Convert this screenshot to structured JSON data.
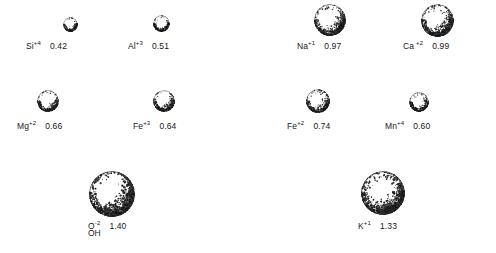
{
  "figure": {
    "background_color": "#ffffff",
    "text_color": "#171717",
    "units": "angstroms"
  },
  "chart_data": {
    "type": "scatter",
    "xlabel": "",
    "ylabel": "",
    "note": "Sphere diameter is proportional to the ionic radius value shown beside each label.",
    "categories": [
      "Si+4",
      "Al+3",
      "Na+1",
      "Ca+2",
      "Mg+2",
      "Fe+3",
      "Fe+2",
      "Mn+4",
      "O-2 / OH",
      "K+1"
    ],
    "values": [
      0.42,
      0.51,
      0.97,
      0.99,
      0.66,
      0.64,
      0.74,
      0.6,
      1.4,
      1.33
    ]
  },
  "ions": [
    {
      "id": "si",
      "symbol": "Si",
      "charge": "+4",
      "radius": "0.42",
      "sublabel": "",
      "sphere": {
        "cx": 70,
        "cy": 24,
        "d": 15
      },
      "label": {
        "x": 26,
        "y": 38
      }
    },
    {
      "id": "al",
      "symbol": "Al",
      "charge": "+3",
      "radius": "0.51",
      "sublabel": "",
      "sphere": {
        "cx": 161,
        "cy": 23,
        "d": 17
      },
      "label": {
        "x": 128,
        "y": 38
      }
    },
    {
      "id": "na",
      "symbol": "Na",
      "charge": "+1",
      "radius": "0.97",
      "sublabel": "",
      "sphere": {
        "cx": 330,
        "cy": 20,
        "d": 32
      },
      "label": {
        "x": 297,
        "y": 38
      }
    },
    {
      "id": "ca",
      "symbol": "Ca",
      "charge": "+2",
      "radius": "0.99",
      "sublabel": "",
      "sphere": {
        "cx": 437,
        "cy": 20,
        "d": 33
      },
      "label": {
        "x": 403,
        "y": 38
      }
    },
    {
      "id": "mg",
      "symbol": "Mg",
      "charge": "+2",
      "radius": "0.66",
      "sublabel": "",
      "sphere": {
        "cx": 48,
        "cy": 101,
        "d": 22
      },
      "label": {
        "x": 17,
        "y": 118
      }
    },
    {
      "id": "fe3",
      "symbol": "Fe",
      "charge": "+3",
      "radius": "0.64",
      "sublabel": "",
      "sphere": {
        "cx": 164,
        "cy": 101,
        "d": 22
      },
      "label": {
        "x": 133,
        "y": 118
      }
    },
    {
      "id": "fe2",
      "symbol": "Fe",
      "charge": "+2",
      "radius": "0.74",
      "sublabel": "",
      "sphere": {
        "cx": 318,
        "cy": 101,
        "d": 24
      },
      "label": {
        "x": 287,
        "y": 118
      }
    },
    {
      "id": "mn",
      "symbol": "Mn",
      "charge": "+4",
      "radius": "0.60",
      "sublabel": "",
      "sphere": {
        "cx": 419,
        "cy": 102,
        "d": 20
      },
      "label": {
        "x": 385,
        "y": 118
      }
    },
    {
      "id": "o",
      "symbol": "O",
      "charge": "-2",
      "radius": "1.40",
      "sublabel": "OH",
      "sphere": {
        "cx": 112,
        "cy": 194,
        "d": 46
      },
      "label": {
        "x": 88,
        "y": 218
      }
    },
    {
      "id": "k",
      "symbol": "K",
      "charge": "+1",
      "radius": "1.33",
      "sublabel": "",
      "sphere": {
        "cx": 383,
        "cy": 193,
        "d": 44
      },
      "label": {
        "x": 358,
        "y": 218
      }
    }
  ]
}
